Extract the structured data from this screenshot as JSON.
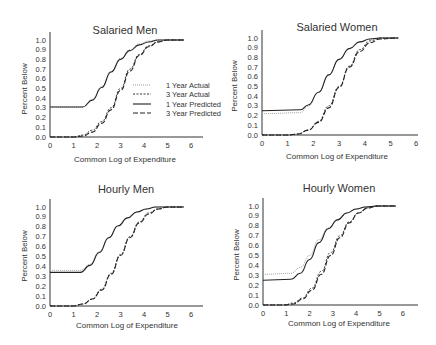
{
  "figure": {
    "x_label": "Common Log of Expenditure",
    "y_label": "Percent Below",
    "x_ticks": [
      0,
      1,
      2,
      3,
      4,
      5,
      6
    ],
    "y_ticks": [
      "0.0",
      "0.1",
      "0.2",
      "0.3",
      "0.4",
      "0.5",
      "0.6",
      "0.7",
      "0.8",
      "0.9",
      "1.0"
    ],
    "legend": [
      {
        "label": "1 Year Actual",
        "style": "dotted-light"
      },
      {
        "label": "3 Year Actual",
        "style": "dotted-dark"
      },
      {
        "label": "1 Year Predicted",
        "style": "solid"
      },
      {
        "label": "3 Year Predicted",
        "style": "dashed"
      }
    ]
  },
  "chart_data": [
    {
      "type": "line",
      "title": "Salaried Men",
      "xlabel": "Common Log of Expenditure",
      "ylabel": "Percent Below",
      "xlim": [
        0,
        6.5
      ],
      "ylim": [
        0,
        1.0
      ],
      "grid": false,
      "legend_position": "center-right",
      "series": [
        {
          "name": "1 Year Actual",
          "x": [
            0,
            1.4,
            1.8,
            2.2,
            2.6,
            3.0,
            3.4,
            3.8,
            4.2,
            4.6,
            5.0,
            5.7
          ],
          "y": [
            0.31,
            0.31,
            0.39,
            0.52,
            0.68,
            0.81,
            0.9,
            0.96,
            0.99,
            1.0,
            1.0,
            1.0
          ]
        },
        {
          "name": "3 Year Actual",
          "x": [
            0,
            1.0,
            1.4,
            1.8,
            2.2,
            2.6,
            3.0,
            3.4,
            3.8,
            4.2,
            4.6,
            5.0,
            5.7
          ],
          "y": [
            0.0,
            0.0,
            0.02,
            0.07,
            0.16,
            0.3,
            0.5,
            0.7,
            0.85,
            0.94,
            0.98,
            1.0,
            1.0
          ]
        },
        {
          "name": "1 Year Predicted",
          "x": [
            0,
            1.4,
            1.8,
            2.2,
            2.6,
            3.0,
            3.4,
            3.8,
            4.2,
            4.6,
            5.0,
            5.7
          ],
          "y": [
            0.31,
            0.31,
            0.38,
            0.51,
            0.67,
            0.8,
            0.89,
            0.95,
            0.98,
            1.0,
            1.0,
            1.0
          ]
        },
        {
          "name": "3 Year Predicted",
          "x": [
            0,
            1.0,
            1.4,
            1.8,
            2.2,
            2.6,
            3.0,
            3.4,
            3.8,
            4.2,
            4.6,
            5.0,
            5.7
          ],
          "y": [
            0.0,
            0.0,
            0.01,
            0.05,
            0.14,
            0.28,
            0.48,
            0.68,
            0.84,
            0.93,
            0.98,
            1.0,
            1.0
          ]
        }
      ]
    },
    {
      "type": "line",
      "title": "Salaried Women",
      "xlabel": "Common Log of Expenditure",
      "ylabel": "Percent Below",
      "xlim": [
        0,
        6
      ],
      "ylim": [
        0,
        1.0
      ],
      "grid": false,
      "series": [
        {
          "name": "1 Year Actual",
          "x": [
            0,
            1.5,
            1.8,
            2.2,
            2.6,
            3.0,
            3.4,
            3.8,
            4.2,
            4.6,
            5.3
          ],
          "y": [
            0.22,
            0.23,
            0.3,
            0.44,
            0.62,
            0.78,
            0.89,
            0.96,
            0.99,
            1.0,
            1.0
          ]
        },
        {
          "name": "3 Year Actual",
          "x": [
            0,
            1.0,
            1.4,
            1.8,
            2.2,
            2.6,
            3.0,
            3.4,
            3.8,
            4.2,
            4.6,
            5.3
          ],
          "y": [
            0.0,
            0.0,
            0.01,
            0.05,
            0.14,
            0.3,
            0.5,
            0.71,
            0.88,
            0.97,
            1.0,
            1.0
          ]
        },
        {
          "name": "1 Year Predicted",
          "x": [
            0,
            1.5,
            1.8,
            2.2,
            2.6,
            3.0,
            3.4,
            3.8,
            4.2,
            4.6,
            5.3
          ],
          "y": [
            0.25,
            0.26,
            0.31,
            0.44,
            0.62,
            0.78,
            0.89,
            0.96,
            0.99,
            1.0,
            1.0
          ]
        },
        {
          "name": "3 Year Predicted",
          "x": [
            0,
            1.0,
            1.4,
            1.8,
            2.2,
            2.6,
            3.0,
            3.4,
            3.8,
            4.2,
            4.6,
            5.3
          ],
          "y": [
            0.0,
            0.0,
            0.01,
            0.05,
            0.13,
            0.28,
            0.49,
            0.7,
            0.86,
            0.95,
            0.99,
            1.0
          ]
        }
      ]
    },
    {
      "type": "line",
      "title": "Hourly Men",
      "xlabel": "Common Log of Expenditure",
      "ylabel": "Percent Below",
      "xlim": [
        0,
        6.5
      ],
      "ylim": [
        0,
        1.0
      ],
      "grid": false,
      "series": [
        {
          "name": "1 Year Actual",
          "x": [
            0,
            1.3,
            1.7,
            2.1,
            2.5,
            2.9,
            3.3,
            3.7,
            4.1,
            4.5,
            5.0,
            5.7
          ],
          "y": [
            0.36,
            0.36,
            0.42,
            0.55,
            0.69,
            0.81,
            0.89,
            0.95,
            0.98,
            1.0,
            1.0,
            1.0
          ]
        },
        {
          "name": "3 Year Actual",
          "x": [
            0,
            1.0,
            1.4,
            1.8,
            2.2,
            2.6,
            3.0,
            3.4,
            3.8,
            4.2,
            4.6,
            5.0,
            5.7
          ],
          "y": [
            0.0,
            0.0,
            0.02,
            0.07,
            0.17,
            0.33,
            0.52,
            0.7,
            0.85,
            0.94,
            0.98,
            1.0,
            1.0
          ]
        },
        {
          "name": "1 Year Predicted",
          "x": [
            0,
            1.3,
            1.7,
            2.1,
            2.5,
            2.9,
            3.3,
            3.7,
            4.1,
            4.5,
            5.0,
            5.7
          ],
          "y": [
            0.34,
            0.34,
            0.41,
            0.54,
            0.69,
            0.81,
            0.89,
            0.95,
            0.98,
            1.0,
            1.0,
            1.0
          ]
        },
        {
          "name": "3 Year Predicted",
          "x": [
            0,
            1.0,
            1.4,
            1.8,
            2.2,
            2.6,
            3.0,
            3.4,
            3.8,
            4.2,
            4.6,
            5.0,
            5.7
          ],
          "y": [
            0.0,
            0.0,
            0.02,
            0.07,
            0.16,
            0.32,
            0.51,
            0.69,
            0.84,
            0.93,
            0.98,
            1.0,
            1.0
          ]
        }
      ]
    },
    {
      "type": "line",
      "title": "Hourly Women",
      "xlabel": "Common Log of Expenditure",
      "ylabel": "Percent Below",
      "xlim": [
        0,
        6.5
      ],
      "ylim": [
        0,
        1.0
      ],
      "grid": false,
      "series": [
        {
          "name": "1 Year Actual",
          "x": [
            0,
            1.2,
            1.6,
            2.0,
            2.4,
            2.8,
            3.2,
            3.6,
            4.0,
            4.4,
            4.9,
            5.7
          ],
          "y": [
            0.31,
            0.32,
            0.38,
            0.5,
            0.66,
            0.78,
            0.86,
            0.93,
            0.97,
            0.99,
            1.0,
            1.0
          ]
        },
        {
          "name": "3 Year Actual",
          "x": [
            0,
            0.9,
            1.3,
            1.7,
            2.1,
            2.5,
            2.9,
            3.3,
            3.7,
            4.1,
            4.5,
            4.9,
            5.7
          ],
          "y": [
            0.0,
            0.0,
            0.02,
            0.07,
            0.17,
            0.34,
            0.53,
            0.7,
            0.84,
            0.93,
            0.98,
            1.0,
            1.0
          ]
        },
        {
          "name": "1 Year Predicted",
          "x": [
            0,
            1.2,
            1.6,
            2.0,
            2.4,
            2.8,
            3.2,
            3.6,
            4.0,
            4.4,
            4.9,
            5.7
          ],
          "y": [
            0.25,
            0.26,
            0.32,
            0.46,
            0.63,
            0.77,
            0.86,
            0.93,
            0.97,
            0.99,
            1.0,
            1.0
          ]
        },
        {
          "name": "3 Year Predicted",
          "x": [
            0,
            0.9,
            1.3,
            1.7,
            2.1,
            2.5,
            2.9,
            3.3,
            3.7,
            4.1,
            4.5,
            4.9,
            5.7
          ],
          "y": [
            0.0,
            0.0,
            0.01,
            0.06,
            0.15,
            0.31,
            0.5,
            0.68,
            0.83,
            0.93,
            0.98,
            1.0,
            1.0
          ]
        }
      ]
    }
  ]
}
